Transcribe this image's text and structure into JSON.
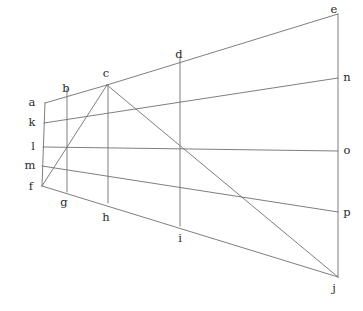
{
  "figure": {
    "stroke_color": "#6f6f6f",
    "label_color": "#2a2a2a",
    "background_color": "#ffffff",
    "canvas": {
      "width": 363,
      "height": 311
    }
  },
  "points": {
    "a": {
      "label": "a",
      "x": 45,
      "y": 103,
      "label_x": 32,
      "label_y": 103
    },
    "b": {
      "label": "b",
      "x": 67,
      "y": 89,
      "label_x": 66,
      "label_y": 89
    },
    "c": {
      "label": "c",
      "x": 107,
      "y": 85,
      "label_x": 106,
      "label_y": 74
    },
    "d": {
      "label": "d",
      "x": 180,
      "y": 57,
      "label_x": 179,
      "label_y": 55
    },
    "e": {
      "label": "e",
      "x": 338,
      "y": 14,
      "label_x": 333,
      "label_y": 10
    },
    "f": {
      "label": "f",
      "x": 42,
      "y": 186,
      "label_x": 31,
      "label_y": 187
    },
    "g": {
      "label": "g",
      "x": 67,
      "y": 192,
      "label_x": 64,
      "label_y": 203
    },
    "h": {
      "label": "h",
      "x": 108,
      "y": 203,
      "label_x": 106,
      "label_y": 218
    },
    "i": {
      "label": "i",
      "x": 180,
      "y": 226,
      "label_x": 180,
      "label_y": 239
    },
    "j": {
      "label": "j",
      "x": 338,
      "y": 277,
      "label_x": 333,
      "label_y": 289
    },
    "k": {
      "label": "k",
      "x": 44,
      "y": 123,
      "label_x": 32,
      "label_y": 123
    },
    "l": {
      "label": "l",
      "x": 43,
      "y": 147,
      "label_x": 33,
      "label_y": 147
    },
    "m": {
      "label": "m",
      "x": 42,
      "y": 166,
      "label_x": 30,
      "label_y": 166
    },
    "n": {
      "label": "n",
      "x": 338,
      "y": 78,
      "label_x": 345,
      "label_y": 78
    },
    "o": {
      "label": "o",
      "x": 338,
      "y": 151,
      "label_x": 345,
      "label_y": 151
    },
    "p": {
      "label": "p",
      "x": 338,
      "y": 212,
      "label_x": 345,
      "label_y": 213
    }
  },
  "segments": [
    {
      "name": "left-edge-a-f",
      "from": "a",
      "to": "f"
    },
    {
      "name": "right-edge-e-j",
      "from": "e",
      "to": "j"
    },
    {
      "name": "top-rail-a-c-e",
      "from": "a",
      "to": "e",
      "via": "c"
    },
    {
      "name": "rail-k-n",
      "from": "k",
      "to": "n"
    },
    {
      "name": "rail-l-o",
      "from": "l",
      "to": "o"
    },
    {
      "name": "rail-m-p",
      "from": "m",
      "to": "p"
    },
    {
      "name": "bottom-rail-f-j",
      "from": "f",
      "to": "j"
    },
    {
      "name": "vertical-b-g",
      "from": "b",
      "to": "g"
    },
    {
      "name": "vertical-c-h",
      "from": "c",
      "to": "h"
    },
    {
      "name": "vertical-d-i",
      "from": "d",
      "to": "i"
    },
    {
      "name": "diagonal-f-c",
      "from": "f",
      "to": "c"
    },
    {
      "name": "diagonal-c-j",
      "from": "c",
      "to": "j"
    }
  ],
  "labels_order": [
    "a",
    "b",
    "c",
    "d",
    "e",
    "f",
    "g",
    "h",
    "i",
    "j",
    "k",
    "l",
    "m",
    "n",
    "o",
    "p"
  ]
}
